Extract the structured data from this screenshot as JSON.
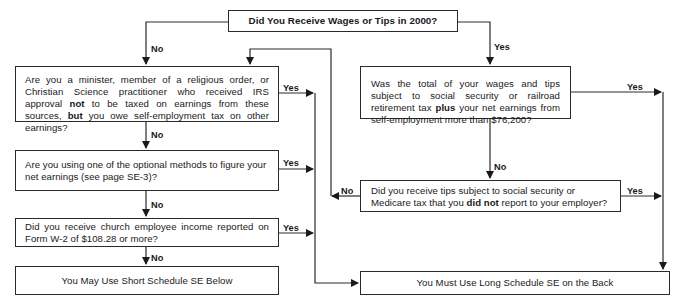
{
  "flowchart": {
    "start": {
      "text": "Did You Receive Wages or Tips in 2000?"
    },
    "left": {
      "q1": {
        "pre": "Are you a minister, member of a religious order, or Christian Science practitioner who received IRS approval ",
        "bold1": "not",
        "mid": " to be taxed on earnings from these sources, ",
        "bold2": "but",
        "post": " you owe self-employment tax on other earnings?"
      },
      "q2": {
        "text": "Are you using one of the optional methods to figure your net earnings (see page SE-3)?"
      },
      "q3": {
        "text": "Did you receive church employee income reported on Form W-2 of $108.28 or more?"
      },
      "result": {
        "text": "You May Use Short Schedule SE Below"
      }
    },
    "right": {
      "q1": {
        "pre": "Was the total of your wages and tips subject to social security or railroad retirement tax ",
        "bold": "plus",
        "post": " your net earnings from self-employment more than $76,200?"
      },
      "q2": {
        "pre": "Did you receive tips subject to social security or Medicare tax that you ",
        "bold": "did not",
        "post": " report to your employer?"
      },
      "result": {
        "text": "You Must Use Long Schedule SE on the Back"
      }
    },
    "labels": {
      "start_no": "No",
      "start_yes": "Yes",
      "left_q1_yes": "Yes",
      "left_q1_no": "No",
      "left_q2_yes": "Yes",
      "left_q2_no": "No",
      "left_q3_yes": "Yes",
      "left_q3_no": "No",
      "right_q1_yes": "Yes",
      "right_q1_no": "No",
      "right_q2_yes": "Yes",
      "right_q2_no": "No"
    }
  }
}
